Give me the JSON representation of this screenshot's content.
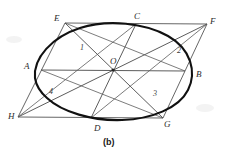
{
  "figure": {
    "caption": "(b)",
    "background_color": "#ffffff",
    "ink_color": "#3d3d3d",
    "ellipse_color": "#111111",
    "label_color": "#2b2b2b",
    "vertex_labels": [
      {
        "name": "E",
        "text": "E",
        "x": 54,
        "y": 14
      },
      {
        "name": "C",
        "text": "C",
        "x": 134,
        "y": 12
      },
      {
        "name": "F",
        "text": "F",
        "x": 210,
        "y": 17
      },
      {
        "name": "A",
        "text": "A",
        "x": 24,
        "y": 62
      },
      {
        "name": "O",
        "text": "O",
        "x": 110,
        "y": 57
      },
      {
        "name": "B",
        "text": "B",
        "x": 196,
        "y": 70
      },
      {
        "name": "H",
        "text": "H",
        "x": 8,
        "y": 112
      },
      {
        "name": "D",
        "text": "D",
        "x": 94,
        "y": 124
      },
      {
        "name": "G",
        "text": "G",
        "x": 164,
        "y": 120
      }
    ],
    "region_labels": [
      {
        "name": "region-1",
        "text": "1",
        "x": 80,
        "y": 44
      },
      {
        "name": "region-2",
        "text": "2",
        "x": 177,
        "y": 47
      },
      {
        "name": "region-3",
        "text": "3",
        "x": 153,
        "y": 90
      },
      {
        "name": "region-4",
        "text": "4",
        "x": 49,
        "y": 88
      }
    ],
    "geometry": {
      "parallelogram": {
        "name": "parallelogram-EFGH",
        "points": "65,23 207,24 163,118 18,117"
      },
      "midpoints": {
        "E_top_left": [
          65,
          23
        ],
        "F_top_right": [
          207,
          24
        ],
        "G_bottom_right": [
          163,
          118
        ],
        "H_bottom_left": [
          18,
          117
        ],
        "A_left_mid": [
          41,
          70
        ],
        "B_right_mid": [
          185,
          71
        ],
        "C_top_mid": [
          136,
          24
        ],
        "D_bottom_mid": [
          91,
          118
        ],
        "O_center": [
          113,
          70
        ]
      },
      "chords": [
        {
          "name": "chord-AB",
          "x1": 41,
          "y1": 70,
          "x2": 185,
          "y2": 71
        },
        {
          "name": "chord-CD",
          "x1": 136,
          "y1": 24,
          "x2": 91,
          "y2": 118
        },
        {
          "name": "diagonal-EG",
          "x1": 65,
          "y1": 23,
          "x2": 163,
          "y2": 118
        },
        {
          "name": "diagonal-HF",
          "x1": 18,
          "y1": 117,
          "x2": 207,
          "y2": 24
        },
        {
          "name": "segment-EB",
          "x1": 65,
          "y1": 23,
          "x2": 185,
          "y2": 71
        },
        {
          "name": "segment-AG",
          "x1": 41,
          "y1": 70,
          "x2": 163,
          "y2": 118
        },
        {
          "name": "segment-HC",
          "x1": 18,
          "y1": 117,
          "x2": 136,
          "y2": 24
        },
        {
          "name": "segment-DF",
          "x1": 91,
          "y1": 118,
          "x2": 207,
          "y2": 24
        }
      ],
      "ellipse": {
        "name": "inscribed-ellipse",
        "path": "M 35,78 C 33,58 52,37 80,28 C 108,19 145,23 168,36 C 191,49 197,72 188,90 C 179,108 152,119 122,120 C 92,121 62,112 47,98 C 39,91 36,85 35,78 Z"
      }
    }
  }
}
